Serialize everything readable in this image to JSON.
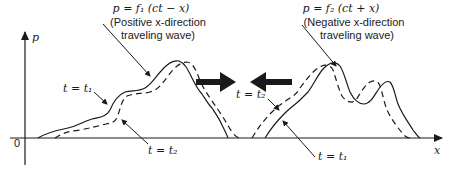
{
  "axes": {
    "y_label": "p",
    "x_label": "x",
    "origin_label": "0"
  },
  "positive_wave": {
    "equation": "p = f₁ (ct − x)",
    "description_line1": "(Positive x-direction",
    "description_line2": "traveling wave)",
    "label_t1": "t = t₁",
    "label_t2": "t = t₂",
    "direction": "positive-x"
  },
  "negative_wave": {
    "equation": "p = f₂ (ct + x)",
    "description_line1": "(Negative x-direction",
    "description_line2": "traveling wave)",
    "label_t1": "t = t₁",
    "label_t2": "t = t₂",
    "direction": "negative-x"
  },
  "legend": {
    "solid_curve": "t = t₁",
    "dashed_curve": "t = t₂"
  },
  "colors": {
    "ink": "#1a1a1a",
    "background": "#ffffff"
  }
}
